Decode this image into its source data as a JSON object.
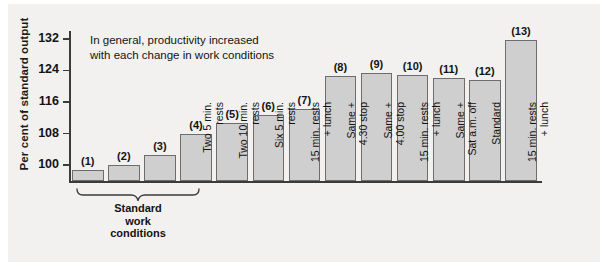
{
  "chart_data": {
    "type": "bar",
    "title": "",
    "subtitle": "",
    "xlabel": "",
    "ylabel": "Per cent of standard output",
    "ylim": [
      96,
      134
    ],
    "yticks": [
      100,
      108,
      116,
      124,
      132
    ],
    "grid": false,
    "legend": null,
    "baseline": 96,
    "categories": [
      "Standard work conditions",
      "Standard work conditions",
      "Standard work conditions",
      "Two 5 min. rests",
      "Two 10 min. rests",
      "Six 5 min. rests",
      "15 min. rests + lunch",
      "Same + 4.30 stop",
      "Same + 4.00 stop",
      "15 min. rests + lunch",
      "Same + Sat a.m. off",
      "Standard",
      "15 min. rests + lunch"
    ],
    "tick_labels": [
      "",
      "",
      "",
      "Two 5 min.\nrests",
      "Two 10 min.\nrests",
      "Six 5 min.\nrests",
      "15 min. rests\n+ lunch",
      "Same +\n4.30 stop",
      "Same +\n4.00 stop",
      "15 min. rests\n+ lunch",
      "Same +\nSat a.m. off",
      "Standard",
      "15 min. rests\n+ lunch"
    ],
    "point_labels": [
      "(1)",
      "(2)",
      "(3)",
      "(4)",
      "(5)",
      "(6)",
      "(7)",
      "(8)",
      "(9)",
      "(10)",
      "(11)",
      "(12)",
      "(13)"
    ],
    "values": [
      98.7,
      100.0,
      102.5,
      107.8,
      110.8,
      112.8,
      114.2,
      122.6,
      123.3,
      122.8,
      122.1,
      121.7,
      131.6
    ],
    "annotations": [
      {
        "text": "In general, productivity increased\nwith each change in work conditions"
      }
    ],
    "group_bracket": {
      "label": "Standard\nwork\nconditions",
      "spans_bars": [
        1,
        2,
        3
      ]
    },
    "colors": {
      "bar_fill": "#cfcfcf",
      "bar_edge": "#6d6d6d",
      "axis": "#3b3b3b",
      "panel_background": "#f2f1ef",
      "text": "#131313"
    }
  }
}
